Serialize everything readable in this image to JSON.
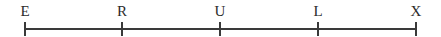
{
  "figure": {
    "type": "number-line",
    "background_color": "#ffffff",
    "line_color": "#3a3a3a",
    "label_color": "#2b2b2b",
    "axis": {
      "x_start": 25,
      "x_end": 416,
      "y": 28,
      "thickness": 2
    },
    "tick": {
      "top": 22,
      "height": 14,
      "thickness": 2
    },
    "label_baseline_top": 4,
    "points": [
      {
        "label": "E",
        "x": 25
      },
      {
        "label": "R",
        "x": 122
      },
      {
        "label": "U",
        "x": 220
      },
      {
        "label": "L",
        "x": 318
      },
      {
        "label": "X",
        "x": 416
      }
    ]
  }
}
